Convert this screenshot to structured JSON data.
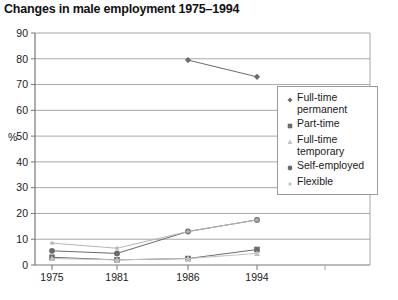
{
  "title": "Changes in male employment 1975–1994",
  "axis": {
    "y_title": "%",
    "y_ticks": [
      0,
      10,
      20,
      30,
      40,
      50,
      60,
      70,
      80,
      90
    ],
    "x_ticks": [
      "1975",
      "1981",
      "1986",
      "1994"
    ]
  },
  "legend": {
    "items": [
      {
        "label": "Full-time\npermanent",
        "marker": "diamond-marker-icon",
        "color": "#6b6b6b"
      },
      {
        "label": "Part-time",
        "marker": "square-marker-icon",
        "color": "#6b6b6b"
      },
      {
        "label": "Full-time\ntemporary",
        "marker": "triangle-marker-icon",
        "color": "#c2c2c2"
      },
      {
        "label": "Self-employed",
        "marker": "circle-marker-icon",
        "color": "#6b6b6b"
      },
      {
        "label": "Flexible",
        "marker": "star-marker-icon",
        "color": "#b5b5b5"
      }
    ]
  },
  "chart_data": {
    "type": "line",
    "title": "Changes in male employment 1975–1994",
    "xlabel": "",
    "ylabel": "%",
    "categories": [
      "1975",
      "1981",
      "1986",
      "1994"
    ],
    "ylim": [
      0,
      90
    ],
    "ytick_step": 10,
    "grid": true,
    "legend_position": "right",
    "series": [
      {
        "name": "Full-time permanent",
        "marker": "diamond",
        "color": "#6b6b6b",
        "values": [
          null,
          null,
          79.5,
          73
        ]
      },
      {
        "name": "Part-time",
        "marker": "square",
        "color": "#6b6b6b",
        "values": [
          3,
          2,
          2.5,
          6
        ]
      },
      {
        "name": "Full-time temporary",
        "marker": "triangle",
        "color": "#c2c2c2",
        "values": [
          2.5,
          2,
          2.5,
          4.5
        ]
      },
      {
        "name": "Self-employed",
        "marker": "circle",
        "color": "#6b6b6b",
        "values": [
          5.5,
          4.5,
          13,
          17.5
        ]
      },
      {
        "name": "Flexible",
        "marker": "star",
        "color": "#b5b5b5",
        "values": [
          8.5,
          6.5,
          13,
          17.5
        ]
      }
    ]
  }
}
